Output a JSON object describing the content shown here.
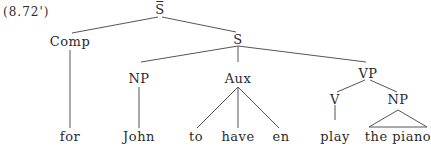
{
  "example_number": "(8.72')",
  "tree": {
    "root": {
      "label": "S",
      "overbar": true
    },
    "nodes": {
      "comp": "Comp",
      "s": "S",
      "np_subject": "NP",
      "aux": "Aux",
      "vp": "VP",
      "v": "V",
      "np_object": "NP"
    },
    "leaves": {
      "for": "for",
      "john": "John",
      "to": "to",
      "have": "have",
      "en": "en",
      "play": "play",
      "the_piano": "the piano"
    }
  }
}
